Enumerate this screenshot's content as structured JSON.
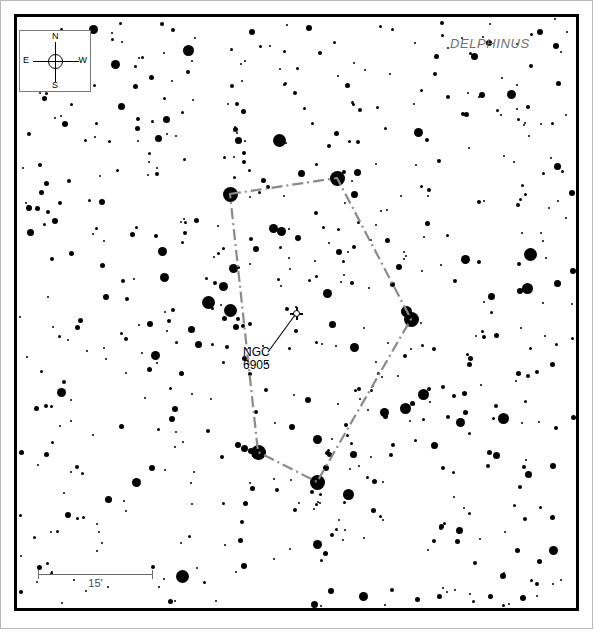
{
  "chart_data": {
    "type": "scatter",
    "title": "",
    "subtitle": "",
    "xlabel": "",
    "ylabel": "",
    "grid": false,
    "legend_position": "none",
    "constellation": "DELPHINUS",
    "orientation": {
      "top": "N",
      "bottom": "S",
      "left": "E",
      "right": "W"
    },
    "scale_bar": {
      "length_label": "15'",
      "value": 15,
      "unit": "arcmin",
      "pixel_length": 115
    },
    "deep_sky_objects": [
      {
        "name": "NGC 6905",
        "label_line1": "NGC",
        "label_line2": "6905",
        "type": "planetary-nebula",
        "x": 296,
        "y": 313
      }
    ],
    "constellation_figure": {
      "style": "dash-dot",
      "color": "#8a8a8a",
      "vertices": [
        {
          "x": 230,
          "y": 194
        },
        {
          "x": 337,
          "y": 178
        },
        {
          "x": 411,
          "y": 319
        },
        {
          "x": 317,
          "y": 482
        },
        {
          "x": 258,
          "y": 452
        }
      ],
      "closed": true
    },
    "star_magnitude_sizes_px": [
      2,
      3,
      4,
      5,
      6,
      7,
      9,
      11,
      13
    ],
    "star_count": 612
  },
  "frame": {
    "outer_border_color": "#b9b9b9",
    "map_border_color": "#000000",
    "background_color": "#ffffff"
  },
  "compass": {
    "north": "N",
    "south": "S",
    "east": "E",
    "west": "W"
  },
  "constellation_label": {
    "text": "DELPHINUS",
    "color": "#6f6f6f"
  },
  "dso": {
    "line1": "NGC",
    "line2": "6905"
  },
  "scale": {
    "label": "15'"
  }
}
